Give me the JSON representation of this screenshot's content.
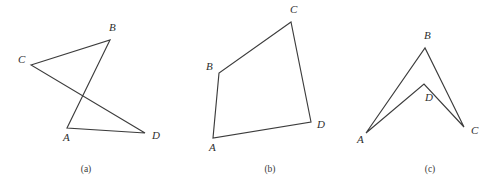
{
  "page": {
    "background_color": "#ffffff",
    "stroke_color": "#3c3c3c",
    "label_color": "#2e2e2e",
    "width": 500,
    "height": 184
  },
  "figures": [
    {
      "id": "figure-a",
      "caption": "(a)",
      "caption_pos": {
        "x": 86,
        "y": 172
      },
      "shape_type": "self-intersecting-quadrilateral",
      "path": "31,65 110,40 67,128 145,133 31,65",
      "closed": true,
      "vertices": [
        {
          "name": "A",
          "x": 67,
          "y": 128,
          "label": "A",
          "label_x": 63,
          "label_y": 141
        },
        {
          "name": "B",
          "x": 110,
          "y": 40,
          "label": "B",
          "label_x": 109,
          "label_y": 31
        },
        {
          "name": "C",
          "x": 31,
          "y": 65,
          "label": "C",
          "label_x": 18,
          "label_y": 63
        },
        {
          "name": "D",
          "x": 145,
          "y": 133,
          "label": "D",
          "label_x": 152,
          "label_y": 139
        }
      ],
      "edges": [
        {
          "from": "C",
          "to": "B"
        },
        {
          "from": "B",
          "to": "A"
        },
        {
          "from": "A",
          "to": "D"
        },
        {
          "from": "D",
          "to": "C"
        }
      ]
    },
    {
      "id": "figure-b",
      "caption": "(b)",
      "caption_pos": {
        "x": 270,
        "y": 172
      },
      "shape_type": "convex-quadrilateral",
      "path": "213,138 219,73 291,22 311,122 213,138",
      "closed": true,
      "vertices": [
        {
          "name": "A",
          "x": 213,
          "y": 138,
          "label": "A",
          "label_x": 209,
          "label_y": 151
        },
        {
          "name": "B",
          "x": 219,
          "y": 73,
          "label": "B",
          "label_x": 206,
          "label_y": 70
        },
        {
          "name": "C",
          "x": 291,
          "y": 22,
          "label": "C",
          "label_x": 290,
          "label_y": 13
        },
        {
          "name": "D",
          "x": 311,
          "y": 122,
          "label": "D",
          "label_x": 317,
          "label_y": 128
        }
      ],
      "edges": [
        {
          "from": "A",
          "to": "B"
        },
        {
          "from": "B",
          "to": "C"
        },
        {
          "from": "C",
          "to": "D"
        },
        {
          "from": "D",
          "to": "A"
        }
      ]
    },
    {
      "id": "figure-c",
      "caption": "(c)",
      "caption_pos": {
        "x": 430,
        "y": 172
      },
      "shape_type": "concave-quadrilateral-dart",
      "path": "366,133 425,48 464,127 424,84 366,133",
      "closed": true,
      "vertices": [
        {
          "name": "A",
          "x": 366,
          "y": 133,
          "label": "A",
          "label_x": 357,
          "label_y": 143
        },
        {
          "name": "B",
          "x": 425,
          "y": 48,
          "label": "B",
          "label_x": 424,
          "label_y": 39
        },
        {
          "name": "C",
          "x": 464,
          "y": 127,
          "label": "C",
          "label_x": 471,
          "label_y": 134
        },
        {
          "name": "D",
          "x": 424,
          "y": 84,
          "label": "D",
          "label_x": 425,
          "label_y": 101
        }
      ],
      "edges": [
        {
          "from": "A",
          "to": "B"
        },
        {
          "from": "B",
          "to": "C"
        },
        {
          "from": "C",
          "to": "D"
        },
        {
          "from": "D",
          "to": "A"
        }
      ]
    }
  ]
}
